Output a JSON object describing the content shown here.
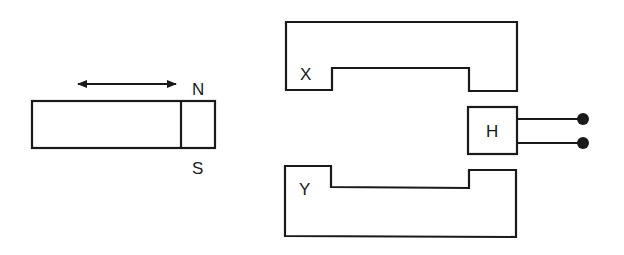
{
  "diagram": {
    "magnet": {
      "north_label": "N",
      "south_label": "S",
      "motion": "double-headed horizontal arrow"
    },
    "cores": {
      "upper_label": "X",
      "lower_label": "Y"
    },
    "sensor": {
      "label": "H",
      "terminals": 2
    },
    "colors": {
      "line": "#1a1a1a",
      "background": "#ffffff"
    }
  }
}
